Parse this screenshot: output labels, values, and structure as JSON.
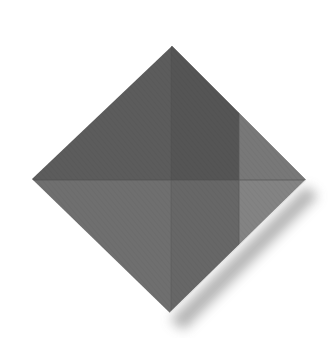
{
  "diagram": {
    "type": "origami-fold-step",
    "colors": {
      "background": "#ffffff",
      "top_left": "#5a5a5a",
      "top_right_flap": "#7a7a7a",
      "bottom_left": "#6e6e6e",
      "bottom_right_flap": "#838383",
      "center_column_top": "#555555",
      "center_column_bottom": "#6a6a6a",
      "crease": "#4a4a4a",
      "shadow": "#9a9a9a",
      "edge_highlight": "#e8e8e8"
    },
    "vertices": {
      "top": [
        172,
        46
      ],
      "right": [
        306,
        180
      ],
      "bottom": [
        170,
        313
      ],
      "left": [
        32,
        179
      ]
    },
    "flap_fold_x": 239,
    "center_crease_x": 171,
    "horizontal_crease_y": 180
  }
}
